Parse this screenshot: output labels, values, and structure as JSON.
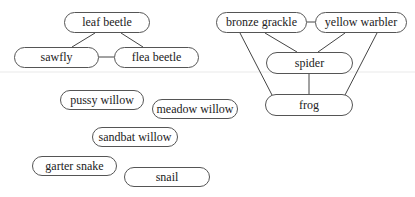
{
  "diagram": {
    "type": "food-web",
    "line_color": "#444444",
    "nodes": [
      {
        "id": "leaf_beetle",
        "label": "leaf beetle",
        "x": 64,
        "y": 12,
        "w": 86,
        "h": 21
      },
      {
        "id": "sawfly",
        "label": "sawfly",
        "x": 14,
        "y": 47,
        "w": 85,
        "h": 21
      },
      {
        "id": "flea_beetle",
        "label": "flea beetle",
        "x": 114,
        "y": 47,
        "w": 85,
        "h": 21
      },
      {
        "id": "bronze_grackle",
        "label": "bronze grackle",
        "x": 216,
        "y": 12,
        "w": 91,
        "h": 21
      },
      {
        "id": "yellow_warbler",
        "label": "yellow warbler",
        "x": 315,
        "y": 12,
        "w": 92,
        "h": 21
      },
      {
        "id": "spider",
        "label": "spider",
        "x": 266,
        "y": 52,
        "w": 87,
        "h": 22
      },
      {
        "id": "frog",
        "label": "frog",
        "x": 265,
        "y": 94,
        "w": 88,
        "h": 22
      },
      {
        "id": "pussy_willow",
        "label": "pussy willow",
        "x": 60,
        "y": 90,
        "w": 84,
        "h": 20
      },
      {
        "id": "meadow_willow",
        "label": "meadow willow",
        "x": 152,
        "y": 99,
        "w": 86,
        "h": 20
      },
      {
        "id": "sandbat_willow",
        "label": "sandbat willow",
        "x": 92,
        "y": 127,
        "w": 86,
        "h": 20
      },
      {
        "id": "garter_snake",
        "label": "garter snake",
        "x": 32,
        "y": 156,
        "w": 85,
        "h": 20
      },
      {
        "id": "snail",
        "label": "snail",
        "x": 124,
        "y": 167,
        "w": 86,
        "h": 20
      }
    ],
    "edges": [
      {
        "from": "leaf_beetle",
        "to": "sawfly",
        "x1": 95,
        "y1": 33,
        "x2": 72,
        "y2": 47
      },
      {
        "from": "leaf_beetle",
        "to": "flea_beetle",
        "x1": 121,
        "y1": 33,
        "x2": 143,
        "y2": 47
      },
      {
        "from": "sawfly",
        "to": "flea_beetle",
        "x1": 99,
        "y1": 57,
        "x2": 114,
        "y2": 57
      },
      {
        "from": "bronze_grackle",
        "to": "yellow_warbler",
        "x1": 307,
        "y1": 22,
        "x2": 315,
        "y2": 22
      },
      {
        "from": "bronze_grackle",
        "to": "spider",
        "x1": 265,
        "y1": 33,
        "x2": 297,
        "y2": 52
      },
      {
        "from": "yellow_warbler",
        "to": "spider",
        "x1": 345,
        "y1": 33,
        "x2": 318,
        "y2": 52
      },
      {
        "from": "bronze_grackle",
        "to": "frog",
        "x1": 240,
        "y1": 33,
        "x2": 272,
        "y2": 95
      },
      {
        "from": "yellow_warbler",
        "to": "frog",
        "x1": 377,
        "y1": 33,
        "x2": 345,
        "y2": 95
      },
      {
        "from": "spider",
        "to": "frog",
        "x1": 309,
        "y1": 74,
        "x2": 309,
        "y2": 94
      }
    ]
  }
}
